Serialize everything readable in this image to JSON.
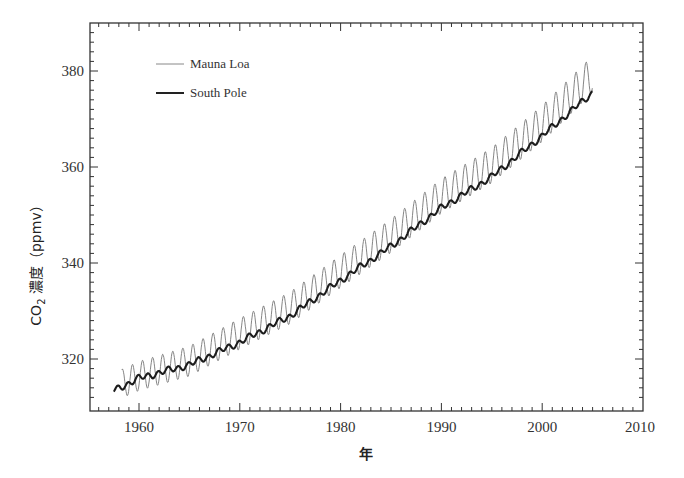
{
  "chart_data": {
    "type": "line",
    "title": "",
    "xlabel": "年",
    "ylabel": "CO₂ 濃度 (ppmv)",
    "ylabel_parts": {
      "prefix": "CO",
      "subscript": "2",
      "suffix": " 濃度（ppmv）"
    },
    "xlim": [
      1955.2,
      2010
    ],
    "ylim": [
      310.5,
      388.5
    ],
    "x_ticks": [
      1960,
      1970,
      1980,
      1990,
      2000,
      2010
    ],
    "y_ticks": [
      320,
      340,
      360,
      380
    ],
    "x_minor_step": 1,
    "y_minor_step": 2,
    "grid": false,
    "legend_position": "upper-left",
    "series": [
      {
        "name": "Mauna Loa",
        "style": "thin",
        "color": "#666666",
        "seasonal_amplitude_ppm": 3.0,
        "x": [
          1958.3,
          1960,
          1965,
          1970,
          1975,
          1980,
          1985,
          1990,
          1995,
          2000,
          2005
        ],
        "values": [
          315.3,
          316.9,
          320.0,
          325.7,
          331.1,
          338.7,
          346.1,
          354.4,
          360.8,
          369.5,
          379.8
        ]
      },
      {
        "name": "South Pole",
        "style": "thick",
        "color": "#222222",
        "x": [
          1957.5,
          1960,
          1965,
          1970,
          1975,
          1980,
          1985,
          1990,
          1995,
          2000,
          2005
        ],
        "values": [
          313.4,
          316.0,
          318.8,
          323.5,
          329.0,
          336.4,
          343.5,
          351.5,
          358.0,
          366.5,
          375.5
        ]
      }
    ]
  },
  "legend": {
    "items": [
      {
        "label": "Mauna Loa"
      },
      {
        "label": "South Pole"
      }
    ]
  },
  "axes": {
    "x_tick_labels": [
      "1960",
      "1970",
      "1980",
      "1990",
      "2000",
      "2010"
    ],
    "y_tick_labels": [
      "320",
      "340",
      "360",
      "380"
    ]
  }
}
